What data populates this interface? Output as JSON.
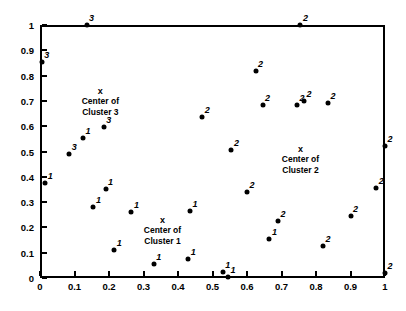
{
  "chart_data": {
    "type": "scatter",
    "title": "",
    "xlabel": "",
    "ylabel": "",
    "xlim": [
      0,
      1
    ],
    "ylim": [
      0,
      1
    ],
    "grid": false,
    "legend": "none",
    "xticks": [
      "0",
      "0.1",
      "0.2",
      "0.3",
      "0.4",
      "0.5",
      "0.6",
      "0.7",
      "0.8",
      "0.9",
      "1"
    ],
    "xtick_values": [
      0,
      0.1,
      0.2,
      0.3,
      0.4,
      0.5,
      0.6,
      0.7,
      0.8,
      0.9,
      1
    ],
    "yticks": [
      "0",
      "0.1",
      "0.2",
      "0.3",
      "0.4",
      "0.5",
      "0.6",
      "0.7",
      "0.8",
      "0.9",
      "1"
    ],
    "ytick_values": [
      0,
      0.1,
      0.2,
      0.3,
      0.4,
      0.5,
      0.6,
      0.7,
      0.8,
      0.9,
      1
    ],
    "point_label_field": "cluster",
    "points": [
      {
        "x": 0.135,
        "y": 1.0,
        "cluster": "3"
      },
      {
        "x": 0.005,
        "y": 0.855,
        "cluster": "3"
      },
      {
        "x": 0.185,
        "y": 0.595,
        "cluster": "3"
      },
      {
        "x": 0.125,
        "y": 0.555,
        "cluster": "1"
      },
      {
        "x": 0.085,
        "y": 0.49,
        "cluster": "3"
      },
      {
        "x": 0.015,
        "y": 0.375,
        "cluster": "1"
      },
      {
        "x": 0.155,
        "y": 0.28,
        "cluster": "1"
      },
      {
        "x": 0.19,
        "y": 0.35,
        "cluster": "1"
      },
      {
        "x": 0.265,
        "y": 0.26,
        "cluster": "1"
      },
      {
        "x": 0.215,
        "y": 0.11,
        "cluster": "1"
      },
      {
        "x": 0.33,
        "y": 0.055,
        "cluster": "1"
      },
      {
        "x": 0.43,
        "y": 0.075,
        "cluster": "1"
      },
      {
        "x": 0.435,
        "y": 0.265,
        "cluster": "1"
      },
      {
        "x": 0.53,
        "y": 0.025,
        "cluster": "1"
      },
      {
        "x": 0.545,
        "y": 0.005,
        "cluster": "1"
      },
      {
        "x": 0.665,
        "y": 0.155,
        "cluster": "1"
      },
      {
        "x": 0.555,
        "y": 0.505,
        "cluster": "2"
      },
      {
        "x": 0.625,
        "y": 0.82,
        "cluster": "2"
      },
      {
        "x": 0.645,
        "y": 0.685,
        "cluster": "2"
      },
      {
        "x": 0.47,
        "y": 0.635,
        "cluster": "2"
      },
      {
        "x": 0.745,
        "y": 0.685,
        "cluster": "2"
      },
      {
        "x": 0.765,
        "y": 0.7,
        "cluster": "2"
      },
      {
        "x": 0.835,
        "y": 0.69,
        "cluster": "2"
      },
      {
        "x": 0.6,
        "y": 0.34,
        "cluster": "2"
      },
      {
        "x": 0.69,
        "y": 0.225,
        "cluster": "2"
      },
      {
        "x": 0.82,
        "y": 0.125,
        "cluster": "2"
      },
      {
        "x": 0.9,
        "y": 0.245,
        "cluster": "2"
      },
      {
        "x": 0.755,
        "y": 1.0,
        "cluster": "2"
      },
      {
        "x": 0.975,
        "y": 0.355,
        "cluster": "2"
      },
      {
        "x": 1.0,
        "y": 0.52,
        "cluster": "2"
      },
      {
        "x": 1.0,
        "y": 0.02,
        "cluster": "2"
      }
    ],
    "cluster_centers": [
      {
        "label_marker": "x",
        "line1": "Center of",
        "line2": "Cluster 3",
        "x": 0.175,
        "y": 0.735
      },
      {
        "label_marker": "x",
        "line1": "Center of",
        "line2": "Cluster 2",
        "x": 0.755,
        "y": 0.505
      },
      {
        "label_marker": "x",
        "line1": "Center of",
        "line2": "Cluster 1",
        "x": 0.355,
        "y": 0.225
      }
    ]
  }
}
